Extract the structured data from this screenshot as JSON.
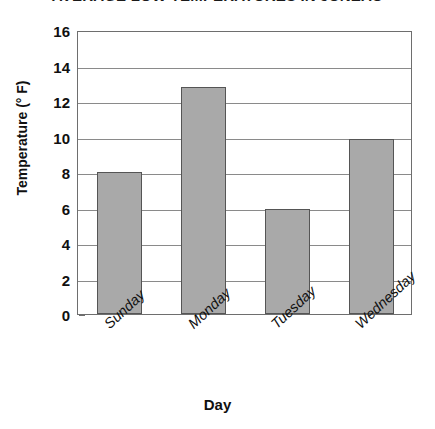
{
  "chart_data": {
    "type": "bar",
    "title": "AVERAGE LOW TEMPERATURES IN JUNEAU",
    "xlabel": "Day",
    "ylabel": "Temperature (° F)",
    "categories": [
      "Sunday",
      "Monday",
      "Tuesday",
      "Wednesday"
    ],
    "values": [
      8.0,
      12.8,
      5.9,
      9.85
    ],
    "ylim": [
      0,
      16
    ],
    "ytick_step": 2,
    "yticks": [
      0,
      2,
      4,
      6,
      8,
      10,
      12,
      14,
      16
    ],
    "ytick_labels": [
      "0",
      "2",
      "4",
      "6",
      "8",
      "10",
      "12",
      "14",
      "16"
    ],
    "grid": true,
    "grid_axis": "y",
    "legend": false,
    "bar_fill_color": "#a9a9a9",
    "bar_border_color": "#555555",
    "axis_color": "#6e6e6e",
    "gridline_color": "#8a8a8a",
    "text_color": "#101010",
    "background_color": "#ffffff",
    "xtick_rotation": -43
  }
}
